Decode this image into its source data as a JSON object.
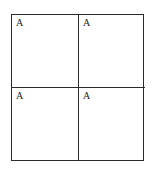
{
  "diagram": {
    "background_color": "#ffffff",
    "line_color": "#2b2b2b",
    "line_width_px": 1,
    "text_color": "#222222",
    "grid": {
      "columns": 2,
      "rows": 2,
      "outer_rect": {
        "x": 11,
        "y": 14,
        "width": 133,
        "height": 147
      },
      "vertical_divider_x": 78,
      "horizontal_divider_y": 87
    },
    "cells": [
      {
        "position": "top-left",
        "row": 0,
        "col": 0,
        "label": "A"
      },
      {
        "position": "top-right",
        "row": 0,
        "col": 1,
        "label": "A"
      },
      {
        "position": "bottom-left",
        "row": 1,
        "col": 0,
        "label": "A"
      },
      {
        "position": "bottom-right",
        "row": 1,
        "col": 1,
        "label": "A"
      }
    ]
  }
}
